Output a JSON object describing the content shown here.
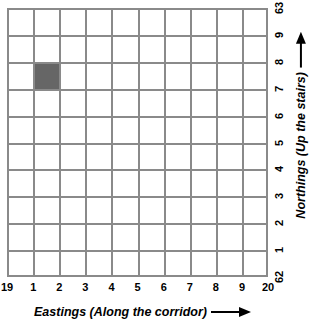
{
  "chart_data": {
    "type": "heatmap",
    "title": "",
    "xlabel": "Eastings (Along the corridor)",
    "ylabel": "Northings (Up the stairs)",
    "xlabel_arrow": "arrow-right-icon",
    "ylabel_arrow": "arrow-up-icon",
    "grid": true,
    "grid_color": "#8a8a8a",
    "fill_color": "#666666",
    "background_color": "#ffffff",
    "columns": 10,
    "rows": 10,
    "x_tick_labels": [
      "19",
      "1",
      "2",
      "3",
      "4",
      "5",
      "6",
      "7",
      "8",
      "9",
      "20"
    ],
    "y_tick_labels_top_to_bottom": [
      "63",
      "9",
      "8",
      "7",
      "6",
      "5",
      "4",
      "3",
      "2",
      "1",
      "62"
    ],
    "xlim": [
      "19",
      "20"
    ],
    "ylim": [
      "62",
      "63"
    ],
    "filled_cells": [
      {
        "easting_from": "1",
        "easting_to": "2",
        "northing_from": "7",
        "northing_to": "8",
        "col_index": 1,
        "row_index_from_top": 2,
        "color": "#666666"
      }
    ]
  }
}
